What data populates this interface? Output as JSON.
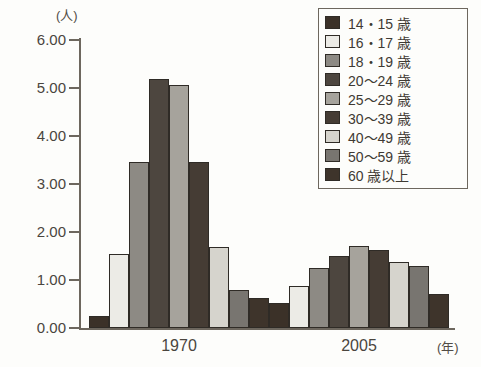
{
  "chart_data": {
    "type": "bar",
    "title": "",
    "xlabel": "(年)",
    "ylabel": "(人)",
    "ylim": [
      0,
      6
    ],
    "ytick_labels": [
      "6.00",
      "5.00",
      "4.00",
      "3.00",
      "2.00",
      "1.00",
      "0.00"
    ],
    "ytick_values": [
      6,
      5,
      4,
      3,
      2,
      1,
      0
    ],
    "grid": false,
    "legend_position": "top-right",
    "categories": [
      "1970",
      "2005"
    ],
    "series": [
      {
        "name": "14・15 歳",
        "color": "#3b3128",
        "values": [
          0.26,
          0.52
        ]
      },
      {
        "name": "16・17 歳",
        "color": "#ecebe6",
        "values": [
          1.54,
          0.88
        ]
      },
      {
        "name": "18・19 歳",
        "color": "#8d8a84",
        "values": [
          3.46,
          1.26
        ]
      },
      {
        "name": "20〜24 歳",
        "color": "#4d463f",
        "values": [
          5.18,
          1.5
        ]
      },
      {
        "name": "25〜29 歳",
        "color": "#a6a39c",
        "values": [
          5.06,
          1.7
        ]
      },
      {
        "name": "30〜39 歳",
        "color": "#453c34",
        "values": [
          3.46,
          1.63
        ]
      },
      {
        "name": "40〜49 歳",
        "color": "#d6d4cd",
        "values": [
          1.68,
          1.38
        ]
      },
      {
        "name": "50〜59 歳",
        "color": "#787570",
        "values": [
          0.8,
          1.29
        ]
      },
      {
        "name": "60 歳以上",
        "color": "#3e342b",
        "values": [
          0.62,
          0.7
        ]
      }
    ]
  },
  "axes": {
    "y_unit": "(人)",
    "x_unit": "(年)"
  },
  "legend": {
    "items": [
      "14・15 歳",
      "16・17 歳",
      "18・19 歳",
      "20〜24 歳",
      "25〜29 歳",
      "30〜39 歳",
      "40〜49 歳",
      "50〜59 歳",
      "60 歳以上"
    ]
  }
}
